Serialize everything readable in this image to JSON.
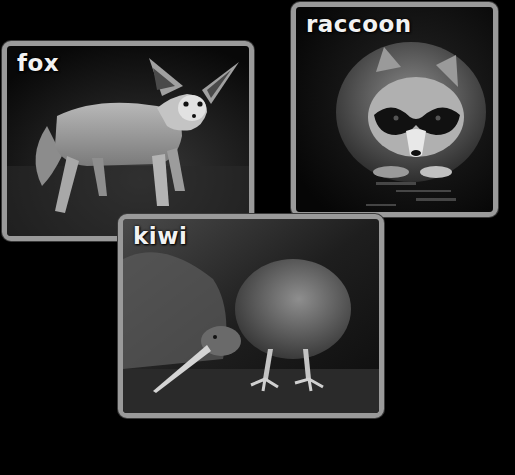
{
  "cards": [
    {
      "id": "fox",
      "label": "fox"
    },
    {
      "id": "raccoon",
      "label": "raccoon"
    },
    {
      "id": "kiwi",
      "label": "kiwi"
    }
  ],
  "colors": {
    "background": "#000000",
    "frame": "#9a9a9a",
    "label": "#f2f2f2"
  }
}
